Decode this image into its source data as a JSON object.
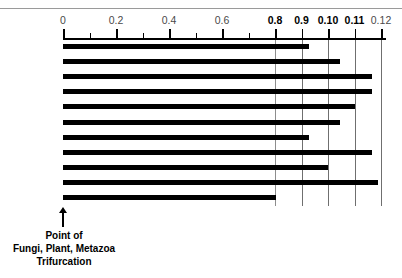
{
  "figure": {
    "name": "phylogenetic-distance-bar-chart",
    "background_color": "#ffffff",
    "bar_color": "#000000",
    "gridline_color": "#8d8d8d",
    "axis_color": "#000000"
  },
  "annotation": {
    "arrow_icon": "up-arrow-icon",
    "caption_line_1": "Point of",
    "caption_line_2": "Fungi, Plant, Metazoa",
    "caption_line_3": "Trifurcation"
  },
  "chart_data": {
    "type": "bar",
    "orientation": "horizontal",
    "title": "",
    "xlabel": "",
    "ylabel": "",
    "grid": true,
    "grid_axis": "x",
    "legend": false,
    "axis_position": "top",
    "xlim": [
      0,
      0.12
    ],
    "tick_labels": [
      "0",
      "0.2",
      "0.4",
      "0.6",
      "0.8",
      "0.9",
      "0.10",
      "0.11",
      "0.12"
    ],
    "tick_units": [
      0,
      2,
      4,
      6,
      8,
      9,
      10,
      11,
      12
    ],
    "tick_bold": [
      false,
      false,
      false,
      false,
      true,
      true,
      true,
      true,
      false
    ],
    "minor_tick_units": [
      1,
      3,
      5,
      7
    ],
    "gridline_units": [
      8,
      9,
      10,
      11,
      12
    ],
    "gridline_strong": [
      false,
      true,
      true,
      true,
      true
    ],
    "categories": [
      "1",
      "2",
      "3",
      "4",
      "5",
      "6",
      "7",
      "8",
      "9",
      "10",
      "11"
    ],
    "values": [
      9.3,
      10.45,
      11.65,
      11.65,
      11.0,
      10.45,
      9.3,
      11.65,
      10.0,
      11.9,
      8.05
    ],
    "value_note": "values expressed in tick-index units matching the printed axis labels"
  }
}
